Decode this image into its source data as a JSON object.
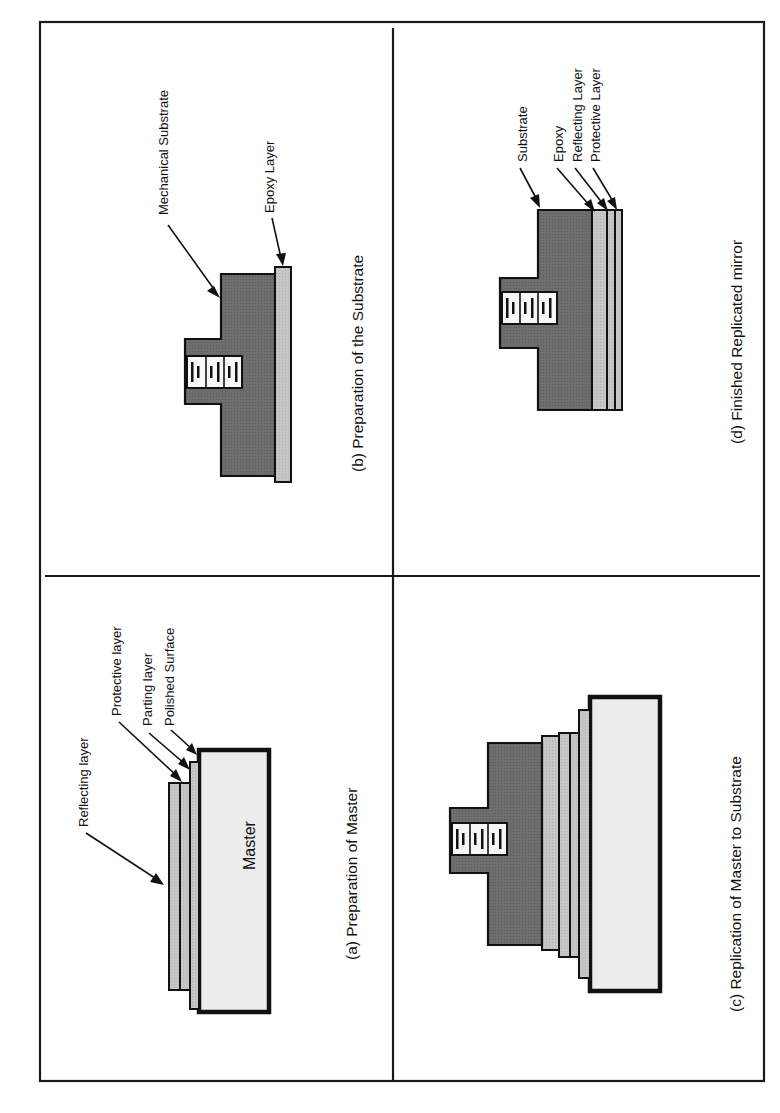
{
  "figure": {
    "orientation": "rotated-90-ccw",
    "panels": {
      "a": {
        "caption": "(a) Preparation of Master",
        "block_label": "Master",
        "labels": {
          "reflecting": "Reflecting layer",
          "protective": "Protective layer",
          "parting": "Parting layer",
          "polished": "Polished Surface"
        }
      },
      "b": {
        "caption": "(b) Preparation of the Substrate",
        "labels": {
          "mechanical": "Mechanical Substrate",
          "epoxy": "Epoxy Layer"
        }
      },
      "c": {
        "caption": "(c) Replication of Master to Substrate"
      },
      "d": {
        "caption": "(d) Finished Replicated mirror",
        "labels": {
          "substrate": "Substrate",
          "epoxy": "Epoxy",
          "reflecting": "Reflecting Layer",
          "protective": "Protective Layer"
        }
      }
    },
    "colors": {
      "substrate": "#6b6b6b",
      "layer": "#c4c4c4",
      "master": "#ececec",
      "line": "#111111"
    }
  }
}
